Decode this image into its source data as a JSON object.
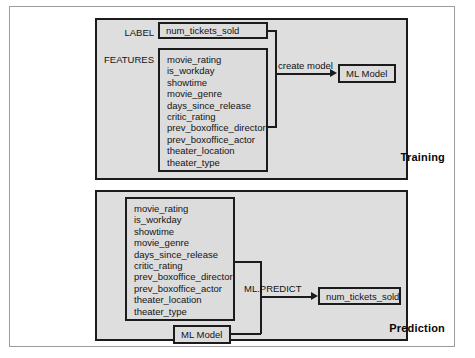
{
  "diagram": {
    "features": [
      "movie_rating",
      "is_workday",
      "showtime",
      "movie_genre",
      "days_since_release",
      "critic_rating",
      "prev_boxoffice_director",
      "prev_boxoffice_actor",
      "theater_location",
      "theater_type"
    ],
    "training": {
      "panel_title": "Training",
      "label_tag": "LABEL",
      "label_value": "num_tickets_sold",
      "features_tag": "FEATURES",
      "edge_label": "create model",
      "model_box": "ML Model"
    },
    "prediction": {
      "panel_title": "Prediction",
      "model_box": "ML Model",
      "edge_label": "ML.PREDICT",
      "output_box": "num_tickets_sold"
    }
  },
  "colors": {
    "panel_fill": "#dedede",
    "box_fill": "#dcdcdc",
    "stroke": "#1b1b1b",
    "frame": "#9b9b9b"
  }
}
